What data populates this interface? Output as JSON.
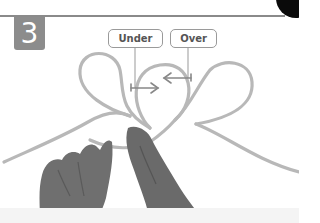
{
  "step": {
    "number": "3"
  },
  "callouts": [
    {
      "label": "Under"
    },
    {
      "label": "Over"
    }
  ],
  "colors": {
    "badge": "#8c8c8c",
    "rope": "#b5b5b5",
    "callout_border": "#9a9a9a",
    "arrow": "#888888",
    "hand": "#6e6e6e",
    "corner": "#0a0a0a"
  }
}
